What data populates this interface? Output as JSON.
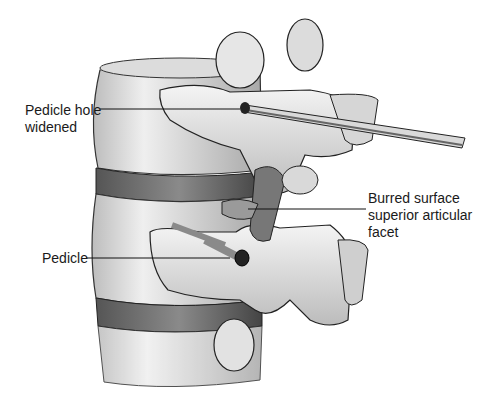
{
  "figure": {
    "labels": [
      {
        "id": "pedicle-hole",
        "text": "Pedicle hole\nwidened"
      },
      {
        "id": "burred-surface",
        "text": "Burred surface\nsuperior articular\nfacet"
      },
      {
        "id": "pedicle",
        "text": "Pedicle"
      }
    ]
  },
  "colors": {
    "background": "#ffffff",
    "ink": "#1a1a1a",
    "bone_light": "#e8e8e8",
    "bone_mid": "#bdbdbd",
    "bone_dark": "#6e6e6e"
  }
}
